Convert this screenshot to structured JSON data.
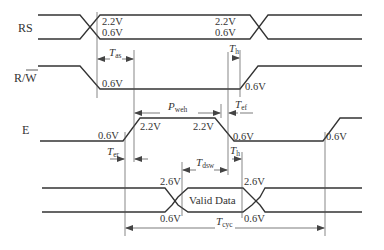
{
  "signals": {
    "rs": {
      "label": "RS"
    },
    "rw": {
      "label": "R/W",
      "label_main": "R/",
      "label_bar": "W"
    },
    "e": {
      "label": "E"
    },
    "data": {
      "label": "Valid Data"
    }
  },
  "voltages": {
    "rs_left_high": "2.2V",
    "rs_left_low": "0.6V",
    "rs_right_high": "2.2V",
    "rs_right_low": "0.6V",
    "rw_fall": "0.6V",
    "rw_rise": "0.6V",
    "e_rise_low": "0.6V",
    "e_rise_high": "2.2V",
    "e_fall_high": "2.2V",
    "e_fall_low": "0.6V",
    "e_second_rise": "0.6V",
    "data_left_high": "2.6V",
    "data_left_low": "0.6V",
    "data_right_high": "2.6V",
    "data_right_low": "0.6V"
  },
  "timings": {
    "tas": {
      "symbol": "T",
      "sub": "as"
    },
    "th_top": {
      "symbol": "T",
      "sub": "h"
    },
    "pweh": {
      "symbol": "P",
      "sub": "weh"
    },
    "tef": {
      "symbol": "T",
      "sub": "ef"
    },
    "ter": {
      "symbol": "T",
      "sub": "er"
    },
    "tdsw": {
      "symbol": "T",
      "sub": "dsw"
    },
    "th_bottom": {
      "symbol": "T",
      "sub": "h"
    },
    "tcyc": {
      "symbol": "T",
      "sub": "cyc"
    }
  }
}
